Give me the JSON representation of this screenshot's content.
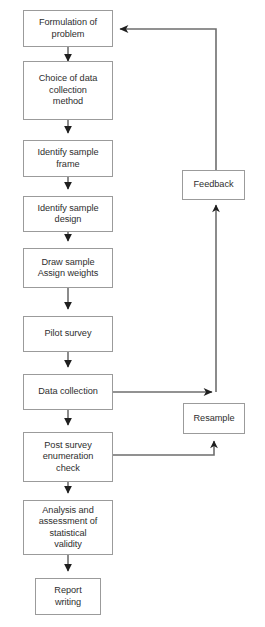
{
  "diagram": {
    "type": "flowchart",
    "colors": {
      "box_border": "#9b9b9b",
      "box_fill": "#ffffff",
      "text": "#2e2e2e",
      "connector_line": "#6e6e6e",
      "arrow_head": "#1f1f1f",
      "background": "#ffffff"
    },
    "main_sequence": [
      {
        "id": "formulation",
        "label": "Formulation of\nproblem"
      },
      {
        "id": "choice-of-data-collection-method",
        "label": "Choice of data\ncollection\nmethod"
      },
      {
        "id": "identify-sample-frame",
        "label": "Identify sample\nframe"
      },
      {
        "id": "identify-sample-design",
        "label": "Identify sample\ndesign"
      },
      {
        "id": "draw-sample-assign-weights",
        "label": "Draw sample\nAssign weights"
      },
      {
        "id": "pilot-survey",
        "label": "Pilot survey"
      },
      {
        "id": "data-collection",
        "label": "Data collection"
      },
      {
        "id": "post-survey-enumeration-check",
        "label": "Post survey\nenumeration\ncheck"
      },
      {
        "id": "analysis-and-assessment",
        "label": "Analysis and\nassessment of\nstatistical\nvalidity"
      },
      {
        "id": "report-writing",
        "label": "Report\nwriting"
      }
    ],
    "side_nodes": [
      {
        "id": "feedback",
        "label": "Feedback"
      },
      {
        "id": "resample",
        "label": "Resample"
      }
    ],
    "connections": [
      {
        "from": "formulation",
        "to": "choice-of-data-collection-method",
        "kind": "down-arrow"
      },
      {
        "from": "choice-of-data-collection-method",
        "to": "identify-sample-frame",
        "kind": "down-arrow"
      },
      {
        "from": "identify-sample-frame",
        "to": "identify-sample-design",
        "kind": "down-arrow"
      },
      {
        "from": "identify-sample-design",
        "to": "draw-sample-assign-weights",
        "kind": "down-arrow"
      },
      {
        "from": "draw-sample-assign-weights",
        "to": "pilot-survey",
        "kind": "down-arrow"
      },
      {
        "from": "pilot-survey",
        "to": "data-collection",
        "kind": "down-arrow"
      },
      {
        "from": "data-collection",
        "to": "post-survey-enumeration-check",
        "kind": "down-arrow"
      },
      {
        "from": "post-survey-enumeration-check",
        "to": "analysis-and-assessment",
        "kind": "down-arrow"
      },
      {
        "from": "analysis-and-assessment",
        "to": "report-writing",
        "kind": "down-arrow"
      },
      {
        "from": "data-collection",
        "to": "feedback",
        "kind": "right-then-up-arrow"
      },
      {
        "from": "feedback",
        "to": "formulation",
        "kind": "up-then-left-arrow"
      },
      {
        "from": "post-survey-enumeration-check",
        "to": "resample",
        "kind": "right-then-up-arrow"
      }
    ]
  }
}
